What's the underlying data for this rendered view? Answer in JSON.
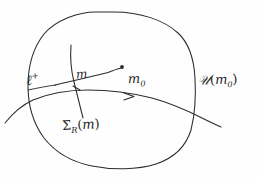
{
  "figure": {
    "kind": "hand-drawn-math-diagram",
    "caption_present": false,
    "background_color": "#fefefe",
    "ink_color": "#2b2b2b",
    "width": 258,
    "height": 178
  },
  "labels": {
    "ell_plus": {
      "base": "ℓ",
      "sup": "+",
      "full": "ℓ⁺"
    },
    "m": {
      "base": "m",
      "full": "m"
    },
    "m_zero": {
      "base": "m",
      "sub": "0",
      "full": "m₀"
    },
    "neighbourhood": {
      "base": "𝒰",
      "open_paren": "(",
      "arg_base": "m",
      "arg_sub": "0",
      "close_paren": ")",
      "full": "𝒰(m₀)"
    },
    "sigma_r_of_m": {
      "base": "Σ",
      "sub": "R",
      "open_paren": "(",
      "arg": "m",
      "close_paren": ")",
      "full": "Σᵣ(m)"
    }
  },
  "shapes": {
    "region_blob": {
      "name": "neighbourhood-boundary",
      "description": "closed rounded blob outline enclosing the construction"
    },
    "flow_line": {
      "name": "ell-plus-curve",
      "description": "long curve entering at left and exiting at right, carrying a direction arrow"
    },
    "arrow": {
      "name": "flow-direction-arrow",
      "position": [
        131,
        98
      ],
      "direction": "rightward"
    },
    "transversal": {
      "name": "sigma-section-curve",
      "description": "short curve crossing the flow line transversally"
    },
    "segment_to_m0": {
      "name": "segment-m-to-m0",
      "description": "curve from the crossing point up-right to the marked point m0"
    },
    "point_m0": {
      "name": "point-m0-marker",
      "position": [
        122,
        67
      ]
    },
    "tick_m": {
      "name": "tick-at-m",
      "position": [
        77,
        88
      ]
    }
  }
}
